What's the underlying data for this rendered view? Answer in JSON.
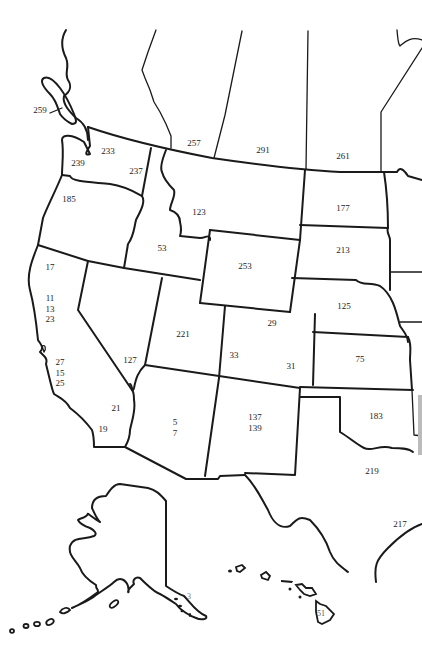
{
  "map": {
    "title": "Western United States numbered map",
    "labels": [
      {
        "region": "bc-island",
        "text": "259",
        "x": 40,
        "y": 110
      },
      {
        "region": "alberta",
        "text": "257",
        "x": 194,
        "y": 143
      },
      {
        "region": "saskatchewan",
        "text": "291",
        "x": 263,
        "y": 150
      },
      {
        "region": "manitoba",
        "text": "261",
        "x": 343,
        "y": 156
      },
      {
        "region": "washington-east",
        "text": "233",
        "x": 108,
        "y": 151
      },
      {
        "region": "washington-west",
        "text": "239",
        "x": 78,
        "y": 163
      },
      {
        "region": "washington-idaho",
        "text": "237",
        "x": 136,
        "y": 171
      },
      {
        "region": "oregon",
        "text": "185",
        "x": 69,
        "y": 199
      },
      {
        "region": "montana",
        "text": "123",
        "x": 199,
        "y": 212
      },
      {
        "region": "north-dakota",
        "text": "177",
        "x": 343,
        "y": 208
      },
      {
        "region": "idaho",
        "text": "53",
        "x": 162,
        "y": 248
      },
      {
        "region": "south-dakota",
        "text": "213",
        "x": 343,
        "y": 250
      },
      {
        "region": "wyoming",
        "text": "253",
        "x": 245,
        "y": 266
      },
      {
        "region": "california-north",
        "text": "17",
        "x": 50,
        "y": 267
      },
      {
        "region": "california-central",
        "text": "11\n13\n23",
        "x": 50,
        "y": 309
      },
      {
        "region": "nebraska",
        "text": "125",
        "x": 344,
        "y": 306
      },
      {
        "region": "utah",
        "text": "221",
        "x": 183,
        "y": 334
      },
      {
        "region": "colorado-north",
        "text": "29",
        "x": 272,
        "y": 323
      },
      {
        "region": "nevada",
        "text": "127",
        "x": 130,
        "y": 360
      },
      {
        "region": "colorado-west",
        "text": "33",
        "x": 234,
        "y": 355
      },
      {
        "region": "colorado-east",
        "text": "31",
        "x": 291,
        "y": 366
      },
      {
        "region": "kansas",
        "text": "75",
        "x": 360,
        "y": 359
      },
      {
        "region": "california-coast",
        "text": "27\n15\n25",
        "x": 60,
        "y": 373
      },
      {
        "region": "california-south",
        "text": "21",
        "x": 116,
        "y": 408
      },
      {
        "region": "california-la",
        "text": "19",
        "x": 103,
        "y": 429
      },
      {
        "region": "arizona",
        "text": "5\n7",
        "x": 175,
        "y": 427
      },
      {
        "region": "new-mexico",
        "text": "137\n139",
        "x": 255,
        "y": 422
      },
      {
        "region": "oklahoma",
        "text": "183",
        "x": 376,
        "y": 416
      },
      {
        "region": "texas",
        "text": "219",
        "x": 372,
        "y": 471
      },
      {
        "region": "texas-east",
        "text": "217",
        "x": 400,
        "y": 524
      },
      {
        "region": "alaska",
        "text": "3",
        "x": 189,
        "y": 597
      },
      {
        "region": "hawaii",
        "text": "51",
        "x": 321,
        "y": 614
      }
    ]
  }
}
